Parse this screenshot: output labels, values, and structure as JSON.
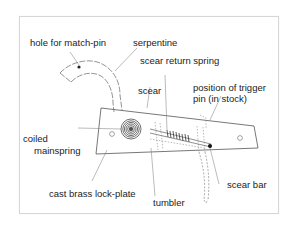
{
  "diagram": {
    "colors": {
      "line": "#555555",
      "leader": "#777777",
      "text": "#222222",
      "frame": "#d6d6d6"
    },
    "labels": {
      "hole_for_match_pin": "hole for match-pin",
      "serpentine": "serpentine",
      "scear_return_spring": "scear return spring",
      "position_trigger_line1": "position of trigger",
      "position_trigger_line2": "pin (in stock)",
      "scear": "scear",
      "coiled_line1": "coiled",
      "coiled_line2": "mainspring",
      "cast_brass_lock_plate": "cast brass lock-plate",
      "tumbler": "tumbler",
      "scear_bar": "scear bar"
    }
  }
}
